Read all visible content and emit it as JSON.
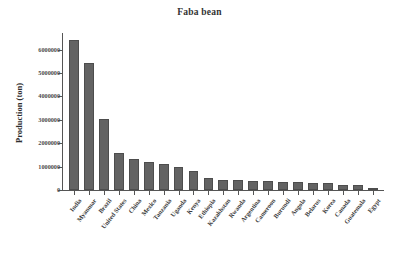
{
  "chart_data": {
    "type": "bar",
    "title": "Faba bean",
    "xlabel": "",
    "ylabel": "Production (ton)",
    "ylim": [
      0,
      6500000
    ],
    "grid": false,
    "legend": null,
    "bar_color": "#636363",
    "categories": [
      "India",
      "Myanmar",
      "Brazil",
      "United States",
      "China",
      "Mexico",
      "Tanzania",
      "Uganda",
      "Kenya",
      "Ethiopia",
      "Kazakhstan",
      "Rwanda",
      "Argentina",
      "Cameroon",
      "Burundi",
      "Angola",
      "Belarus",
      "Korea",
      "Canada",
      "Guatemala",
      "Egypt"
    ],
    "values": [
      6400000,
      5450000,
      3020000,
      1600000,
      1310000,
      1180000,
      1120000,
      1000000,
      820000,
      520000,
      430000,
      430000,
      390000,
      390000,
      360000,
      350000,
      320000,
      280000,
      225000,
      215000,
      70000
    ],
    "ytick_labels": [
      "0",
      "1000000",
      "2000000",
      "3000000",
      "4000000",
      "5000000",
      "6000000"
    ],
    "ytick_values": [
      0,
      1000000,
      2000000,
      3000000,
      4000000,
      5000000,
      6000000
    ]
  }
}
